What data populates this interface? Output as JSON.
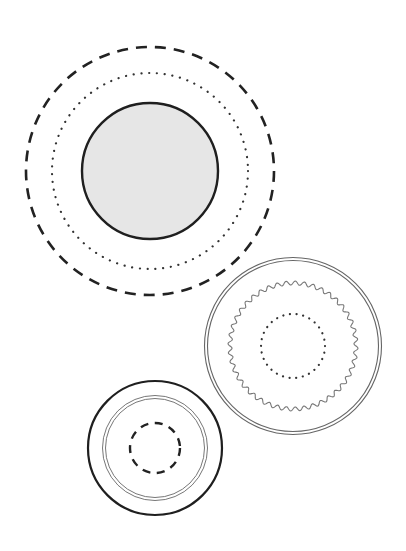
{
  "diagram": {
    "width": 406,
    "height": 551,
    "background": "#ffffff",
    "groups": [
      {
        "name": "top-left-group",
        "center": [
          150,
          171
        ],
        "rings": [
          {
            "name": "outer-dashed-ring",
            "style": "dashed",
            "radius": 124,
            "stroke": "#222222",
            "stroke_width": 2.6,
            "dash": "11 8"
          },
          {
            "name": "middle-dotted-ring",
            "style": "dotted",
            "radius": 98,
            "stroke": "#333333",
            "stroke_width": 2.2,
            "dash": "0.1 7.7"
          },
          {
            "name": "inner-filled-circle",
            "style": "solid-filled",
            "radius": 68,
            "stroke": "#1f1f1f",
            "stroke_width": 2.4,
            "fill": "#e6e6e6"
          }
        ]
      },
      {
        "name": "right-group",
        "center": [
          293,
          346
        ],
        "rings": [
          {
            "name": "outer-double-ring",
            "style": "double",
            "radius": 87,
            "stroke": "#666666",
            "stroke_width": 1.1,
            "gap": 3
          },
          {
            "name": "middle-wavy-ring",
            "style": "wavy",
            "radius": 63,
            "stroke": "#777777",
            "stroke_width": 1.1,
            "waves": 44,
            "amplitude": 2
          },
          {
            "name": "inner-dotted-ring",
            "style": "dotted",
            "radius": 32,
            "stroke": "#333333",
            "stroke_width": 2.2,
            "dash": "0.1 6.6"
          }
        ]
      },
      {
        "name": "bottom-left-group",
        "center": [
          155,
          448
        ],
        "rings": [
          {
            "name": "outer-solid-ring",
            "style": "solid",
            "radius": 67,
            "stroke": "#1f1f1f",
            "stroke_width": 2.2
          },
          {
            "name": "middle-double-ring",
            "style": "double",
            "radius": 51,
            "stroke": "#777777",
            "stroke_width": 1.0,
            "gap": 3
          },
          {
            "name": "inner-dashed-ring",
            "style": "dashed",
            "radius": 25,
            "stroke": "#222222",
            "stroke_width": 2.4,
            "dash": "8 6.6"
          }
        ]
      }
    ]
  }
}
